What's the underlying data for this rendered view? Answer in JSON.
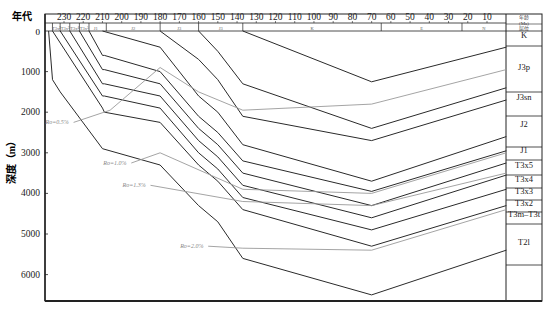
{
  "chart_data": {
    "type": "line",
    "xlabel": "年代",
    "ylabel": "深度（m）",
    "xaxis": {
      "label": "年代",
      "unit": "Ma",
      "reversed": true,
      "range": [
        240,
        0
      ],
      "ticks": [
        230,
        220,
        210,
        200,
        190,
        180,
        170,
        160,
        150,
        140,
        130,
        120,
        110,
        100,
        90,
        80,
        70,
        60,
        50,
        40,
        30,
        20,
        10
      ]
    },
    "yaxis": {
      "label": "深度（m）",
      "range": [
        0,
        6600
      ],
      "ticks": [
        0,
        1000,
        2000,
        3000,
        4000,
        5000,
        6000
      ],
      "inverted": true
    },
    "period_bar": [
      {
        "label": "T3x²",
        "from": 236,
        "to": 232
      },
      {
        "label": "T3x³",
        "from": 232,
        "to": 227
      },
      {
        "label": "T3x⁴",
        "from": 227,
        "to": 222
      },
      {
        "label": "T3x⁵",
        "from": 222,
        "to": 217
      },
      {
        "label": "J1",
        "from": 217,
        "to": 210
      },
      {
        "label": "J2",
        "from": 208,
        "to": 180
      },
      {
        "label": "J3",
        "from": 180,
        "to": 160
      },
      {
        "label": "J3",
        "from": 160,
        "to": 137
      },
      {
        "label": "K",
        "from": 137,
        "to": 65
      },
      {
        "label": "E",
        "from": 65,
        "to": 23
      },
      {
        "label": "N",
        "from": 23,
        "to": 0
      }
    ],
    "legend_column": {
      "header": [
        "年龄",
        "(Ma)",
        "层位"
      ],
      "layers": [
        "K",
        "J3p",
        "J3sn",
        "J2",
        "J1",
        "T3x⁵",
        "T3x⁴",
        "T3x³",
        "T3x²",
        "T3m-T3t",
        "T2l"
      ]
    },
    "series": [
      {
        "name": "T2l base",
        "x": [
          238,
          236,
          232,
          210,
          180,
          160,
          150,
          137,
          70,
          0
        ],
        "y": [
          0,
          1200,
          1500,
          2900,
          3300,
          4300,
          4700,
          5600,
          6500,
          5400
        ]
      },
      {
        "name": "T3m-T3t base",
        "x": [
          236,
          210,
          209,
          180,
          160,
          150,
          137,
          70,
          0
        ],
        "y": [
          0,
          1900,
          2000,
          2250,
          3300,
          3700,
          4400,
          5300,
          4300
        ]
      },
      {
        "name": "T3x² base",
        "x": [
          232,
          210,
          209,
          180,
          160,
          150,
          137,
          70,
          0
        ],
        "y": [
          0,
          1600,
          1600,
          1900,
          3000,
          3400,
          4100,
          4900,
          3900
        ]
      },
      {
        "name": "T3x³ base",
        "x": [
          227,
          210,
          209,
          180,
          160,
          150,
          137,
          70,
          0
        ],
        "y": [
          0,
          1300,
          1300,
          1600,
          2700,
          3100,
          3800,
          4600,
          3550
        ]
      },
      {
        "name": "T3x⁴ base",
        "x": [
          222,
          210,
          209,
          180,
          160,
          150,
          137,
          70,
          0
        ],
        "y": [
          0,
          950,
          950,
          1300,
          2400,
          2800,
          3500,
          4300,
          3250
        ]
      },
      {
        "name": "T3x⁵ base",
        "x": [
          217,
          210,
          209,
          180,
          160,
          150,
          137,
          70,
          0
        ],
        "y": [
          0,
          600,
          600,
          1000,
          2100,
          2500,
          3200,
          3950,
          2950
        ]
      },
      {
        "name": "J1 base",
        "x": [
          210,
          180,
          160,
          150,
          137,
          70,
          0
        ],
        "y": [
          0,
          400,
          1600,
          2000,
          2800,
          3700,
          2600
        ]
      },
      {
        "name": "J2 base",
        "x": [
          180,
          160,
          150,
          137,
          70,
          0
        ],
        "y": [
          0,
          700,
          1200,
          2100,
          2700,
          1700
        ]
      },
      {
        "name": "J3sn base",
        "x": [
          160,
          150,
          137,
          70,
          0
        ],
        "y": [
          0,
          500,
          1300,
          2400,
          1400
        ]
      },
      {
        "name": "J3p base",
        "x": [
          137,
          70,
          0
        ],
        "y": [
          0,
          1250,
          400
        ]
      }
    ],
    "isolines": [
      {
        "name": "Ro=0.5%",
        "label": "Ro=0.5%",
        "x": [
          225,
          206,
          180,
          160,
          137,
          70,
          0
        ],
        "y": [
          2250,
          1950,
          900,
          1500,
          1950,
          1800,
          950
        ]
      },
      {
        "name": "Ro=1.0%",
        "label": "Ro=1.0%",
        "x": [
          195,
          180,
          137,
          70,
          0
        ],
        "y": [
          3250,
          3000,
          3900,
          4000,
          3000
        ]
      },
      {
        "name": "Ro=1.3%",
        "label": "Ro=1.3%",
        "x": [
          185,
          137,
          70,
          0
        ],
        "y": [
          3800,
          4200,
          4300,
          3500
        ]
      },
      {
        "name": "Ro=2.0%",
        "label": "Ro=2.0%",
        "x": [
          155,
          137,
          70,
          0
        ],
        "y": [
          5300,
          5350,
          5400,
          4400
        ]
      }
    ]
  },
  "axis": {
    "x_title": "年代",
    "y_title": "深度（m）",
    "zero_label": "0",
    "x_ticks": [
      "230",
      "220",
      "210",
      "200",
      "190",
      "180",
      "170",
      "160",
      "150",
      "140",
      "130",
      "120",
      "110",
      "100",
      "90",
      "80",
      "70",
      "60",
      "50",
      "40",
      "30",
      "20",
      "10"
    ],
    "y_ticks": [
      "1000",
      "2000",
      "3000",
      "4000",
      "5000",
      "6000"
    ]
  },
  "legend": {
    "header_line1": "年龄",
    "header_line2": "(Ma)",
    "header_line3": "层位",
    "layers": [
      "K",
      "J3p",
      "J3sn",
      "J2",
      "J1",
      "T3x5",
      "T3x4",
      "T3x3",
      "T3x2",
      "T3m–T3t",
      "T2l"
    ]
  },
  "ro_labels": [
    "Ro=0.5%",
    "Ro=1.0%",
    "Ro=1.3%",
    "Ro=2.0%"
  ],
  "colors": {
    "line": "#2a2a2a",
    "isoline": "#9a9a9a",
    "frame": "#222222"
  }
}
